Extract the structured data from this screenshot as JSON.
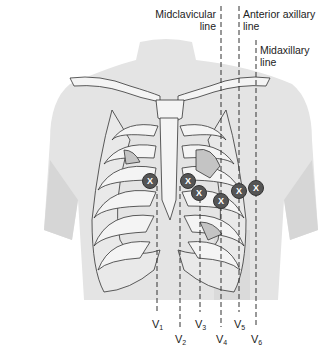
{
  "diagram": {
    "reference_lines": [
      {
        "id": "midclavicular",
        "line1": "Midclavicular",
        "line2": "line",
        "x": 221
      },
      {
        "id": "anterior-axillary",
        "line1": "Anterior axillary",
        "line2": "line",
        "x": 239
      },
      {
        "id": "midaxillary",
        "line1": "Midaxillary",
        "line2": "line",
        "x": 256
      }
    ],
    "electrodes": [
      {
        "id": "V1",
        "letter": "V",
        "num": "1",
        "cx": 150,
        "cy": 181,
        "line_x": 157,
        "label_y": 318
      },
      {
        "id": "V2",
        "letter": "V",
        "num": "2",
        "cx": 188,
        "cy": 181,
        "line_x": 180,
        "label_y": 333
      },
      {
        "id": "V3",
        "letter": "V",
        "num": "3",
        "cx": 199,
        "cy": 193,
        "line_x": 200,
        "label_y": 318
      },
      {
        "id": "V4",
        "letter": "V",
        "num": "4",
        "cx": 221,
        "cy": 201,
        "line_x": 221,
        "label_y": 333
      },
      {
        "id": "V5",
        "letter": "V",
        "num": "5",
        "cx": 239,
        "cy": 191,
        "line_x": 239,
        "label_y": 318
      },
      {
        "id": "V6",
        "letter": "V",
        "num": "6",
        "cx": 256,
        "cy": 188,
        "line_x": 256,
        "label_y": 333
      }
    ],
    "electrode_mark": "X",
    "colors": {
      "body": "#e4e4e4",
      "body_shadow": "#d6d6d6",
      "bone": "#f4f4f4",
      "bone_outline": "#333333",
      "organ": "#c4c4c4",
      "electrode": "#555555",
      "electrode_text": "#ffffff",
      "dash": "#333333"
    }
  }
}
